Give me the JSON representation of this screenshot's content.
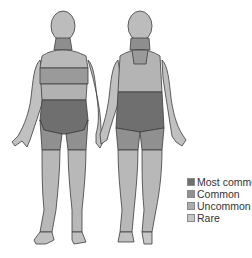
{
  "figure": {
    "views": [
      "front",
      "back"
    ],
    "colors": {
      "most_common": "#6f6f6f",
      "common": "#909090",
      "uncommon": "#acacac",
      "rare": "#c6c6c6",
      "outline": "#3c3c3c"
    }
  },
  "legend": {
    "items": [
      {
        "label": "Most common",
        "color": "#6f6f6f"
      },
      {
        "label": "Common",
        "color": "#909090"
      },
      {
        "label": "Uncommon",
        "color": "#acacac"
      },
      {
        "label": "Rare",
        "color": "#c6c6c6"
      }
    ]
  }
}
